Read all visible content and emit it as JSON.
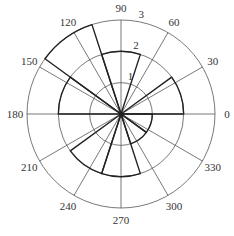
{
  "chart_data": {
    "type": "polar-histogram",
    "title": "",
    "caption": "",
    "angle_unit": "degrees",
    "angular_ticks": [
      0,
      30,
      60,
      90,
      120,
      150,
      180,
      210,
      240,
      270,
      300,
      330
    ],
    "angular_tick_labels": [
      "0",
      "30",
      "60",
      "90",
      "120",
      "150",
      "180",
      "210",
      "240",
      "270",
      "300",
      "330"
    ],
    "radial_ticks": [
      1,
      2,
      3
    ],
    "radial_tick_labels": [
      "1",
      "2",
      "3"
    ],
    "rlim": [
      0,
      3
    ],
    "grid": true,
    "bin_edges_deg": [
      0,
      36,
      72,
      108,
      144,
      180,
      216,
      252,
      288,
      324,
      360
    ],
    "categories": [
      "0-36",
      "36-72",
      "72-108",
      "108-144",
      "144-180",
      "180-216",
      "216-252",
      "252-288",
      "288-324",
      "324-360"
    ],
    "values": [
      2,
      0,
      2,
      3,
      2,
      0,
      2,
      2,
      1,
      1
    ],
    "colors": {
      "grid": "#555555",
      "bars": "#222222",
      "text": "#333333"
    }
  }
}
